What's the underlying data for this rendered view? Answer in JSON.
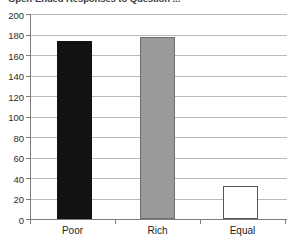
{
  "chart_data": {
    "type": "bar",
    "title": "Open-Ended Responses to Question ...",
    "xlabel": "",
    "ylabel": "",
    "categories": [
      "Poor",
      "Rich",
      "Equal"
    ],
    "values": [
      174,
      178,
      32
    ],
    "series": [
      {
        "name": "Responses",
        "values": [
          174,
          178,
          32
        ],
        "fills": [
          "#121212",
          "#9a9a9a",
          "#ffffff"
        ],
        "edges": [
          "#121212",
          "#6f6f6f",
          "#555555"
        ]
      }
    ],
    "ylim": [
      0,
      200
    ],
    "ytick_step": 20,
    "ytick_labels": [
      "200",
      "180",
      "160",
      "140",
      "120",
      "100",
      "80",
      "60",
      "40",
      "20",
      "0"
    ],
    "ytick_values": [
      200,
      180,
      160,
      140,
      120,
      100,
      80,
      60,
      40,
      20,
      0
    ],
    "grid": true,
    "grid_axis": "y",
    "legend": false,
    "legend_position": "none",
    "bar_labels_shown": false
  },
  "colors": {
    "background": "#ffffff",
    "gridline": "#b9b9b9",
    "axis": "#7d7d7d",
    "tick_text": "#2b2b2b",
    "title_text": "#3a3a3a"
  }
}
